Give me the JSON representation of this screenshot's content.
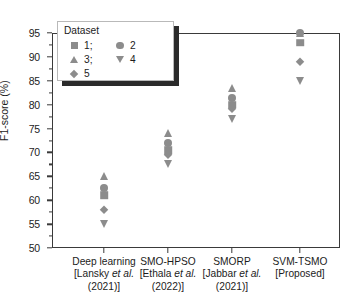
{
  "chart_data": {
    "type": "scatter",
    "title": "",
    "xlabel": "",
    "ylabel": "F1-score (%)",
    "ylim": [
      50,
      95
    ],
    "ytick_labels": [
      "95",
      "90",
      "85",
      "80",
      "75",
      "70",
      "65",
      "60",
      "55",
      "50"
    ],
    "ytick_values": [
      95,
      90,
      85,
      80,
      75,
      70,
      65,
      60,
      55,
      50
    ],
    "grid": false,
    "legend_position": "upper left",
    "legend_title": "Dataset",
    "categories": [
      {
        "name": "Deep learning",
        "citation": "[Lansky et al.",
        "year": "(2021)]"
      },
      {
        "name": "SMO-HPSO",
        "citation": "[Ethala et al.",
        "year": "(2022)]"
      },
      {
        "name": "SMORP",
        "citation": "[Jabbar et al.",
        "year": "(2021)]"
      },
      {
        "name": "SVM-TSMO",
        "citation": "[Proposed]",
        "year": ""
      }
    ],
    "series": [
      {
        "name": "1",
        "marker": "square",
        "values": [
          61.0,
          70.5,
          80.0,
          93.0
        ]
      },
      {
        "name": "2",
        "marker": "circle",
        "values": [
          62.5,
          72.0,
          81.5,
          95.0
        ]
      },
      {
        "name": "3",
        "marker": "triangle-up",
        "values": [
          65.0,
          74.0,
          83.5,
          95.0
        ]
      },
      {
        "name": "4",
        "marker": "triangle-down",
        "values": [
          55.0,
          67.5,
          77.0,
          85.0
        ]
      },
      {
        "name": "5",
        "marker": "diamond",
        "values": [
          58.0,
          69.5,
          79.0,
          89.0
        ]
      }
    ],
    "marker_color": "#8c8c8c",
    "axis_color": "#3a3a3a"
  },
  "legend": {
    "title": "Dataset",
    "entries": [
      {
        "label": "1;",
        "marker": "square"
      },
      {
        "label": "2",
        "marker": "circle"
      },
      {
        "label": "3;",
        "marker": "triangle-up"
      },
      {
        "label": "4",
        "marker": "triangle-down"
      },
      {
        "label": "5",
        "marker": "diamond"
      }
    ]
  }
}
